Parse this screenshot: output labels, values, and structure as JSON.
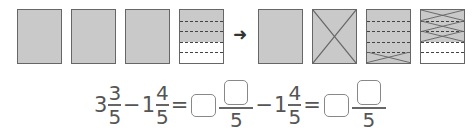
{
  "diagram": {
    "left_group": {
      "boxes": [
        {
          "type": "full-shaded"
        },
        {
          "type": "full-shaded"
        },
        {
          "type": "full-shaded"
        },
        {
          "type": "fifths",
          "shaded_rows": 3,
          "total_rows": 5
        }
      ]
    },
    "arrow": "➜",
    "right_group": {
      "boxes": [
        {
          "type": "full-shaded"
        },
        {
          "type": "full-shaded-crossed"
        },
        {
          "type": "fifths",
          "shaded_rows": 5,
          "crossed_rows": 1
        },
        {
          "type": "fifths",
          "shaded_rows": 3,
          "crossed_rows": 3
        }
      ]
    },
    "colors": {
      "shade": "#c9c9c9",
      "border": "#666666"
    }
  },
  "formula": {
    "term1": {
      "whole": "3",
      "numerator": "3",
      "denominator": "5"
    },
    "minus1": "−",
    "term2": {
      "whole": "1",
      "numerator": "4",
      "denominator": "5"
    },
    "equals1": "=",
    "step1": {
      "denominator": "5"
    },
    "minus2": "−",
    "term3": {
      "whole": "1",
      "numerator": "4",
      "denominator": "5"
    },
    "equals2": "=",
    "result": {
      "denominator": "5"
    }
  }
}
